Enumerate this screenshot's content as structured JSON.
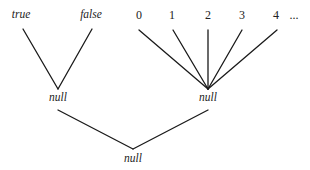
{
  "diagram": {
    "type": "lattice",
    "colors": {
      "edge": "#1a1a1a",
      "text": "#222222",
      "background": "#ffffff"
    },
    "nodes": [
      {
        "id": "true",
        "label": "true",
        "italic": true,
        "x": 21,
        "y": 18
      },
      {
        "id": "false",
        "label": "false",
        "italic": true,
        "x": 91,
        "y": 18
      },
      {
        "id": "n0",
        "label": "0",
        "italic": false,
        "x": 139,
        "y": 19
      },
      {
        "id": "n1",
        "label": "1",
        "italic": false,
        "x": 172,
        "y": 19
      },
      {
        "id": "n2",
        "label": "2",
        "italic": false,
        "x": 208,
        "y": 19
      },
      {
        "id": "n3",
        "label": "3",
        "italic": false,
        "x": 242,
        "y": 19
      },
      {
        "id": "n4",
        "label": "4",
        "italic": false,
        "x": 276,
        "y": 19
      },
      {
        "id": "ellipsis",
        "label": "...",
        "italic": false,
        "x": 294,
        "y": 19
      },
      {
        "id": "null_bool",
        "label": "null",
        "italic": true,
        "x": 58,
        "y": 101
      },
      {
        "id": "null_int",
        "label": "null",
        "italic": true,
        "x": 208,
        "y": 101
      },
      {
        "id": "null_bottom",
        "label": "null",
        "italic": true,
        "x": 133,
        "y": 162
      }
    ],
    "edges": [
      {
        "from": "true",
        "to": "null_bool",
        "x1": 23,
        "y1": 29,
        "x2": 58,
        "y2": 89
      },
      {
        "from": "false",
        "to": "null_bool",
        "x1": 92,
        "y1": 29,
        "x2": 58,
        "y2": 89
      },
      {
        "from": "n0",
        "to": "null_int",
        "x1": 139,
        "y1": 30,
        "x2": 208,
        "y2": 89
      },
      {
        "from": "n1",
        "to": "null_int",
        "x1": 173,
        "y1": 30,
        "x2": 208,
        "y2": 89
      },
      {
        "from": "n2",
        "to": "null_int",
        "x1": 208,
        "y1": 30,
        "x2": 208,
        "y2": 89
      },
      {
        "from": "n3",
        "to": "null_int",
        "x1": 242,
        "y1": 30,
        "x2": 208,
        "y2": 89
      },
      {
        "from": "n4",
        "to": "null_int",
        "x1": 277,
        "y1": 30,
        "x2": 208,
        "y2": 89
      },
      {
        "from": "null_bool",
        "to": "null_bottom",
        "x1": 58,
        "y1": 110,
        "x2": 133,
        "y2": 149
      },
      {
        "from": "null_int",
        "to": "null_bottom",
        "x1": 208,
        "y1": 110,
        "x2": 133,
        "y2": 149
      }
    ]
  }
}
